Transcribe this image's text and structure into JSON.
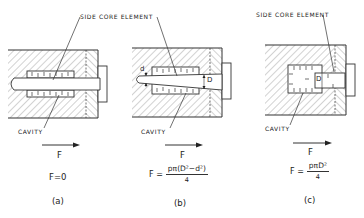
{
  "figure": {
    "panels": [
      {
        "id": "a",
        "caption": "(a)",
        "top_label": "SIDE CORE ELEMENT",
        "bottom_label": "CAVITY",
        "force_label": "F",
        "equation": "F=0"
      },
      {
        "id": "b",
        "caption": "(b)",
        "top_label": "SIDE CORE ELEMENT",
        "bottom_label": "CAVITY",
        "force_label": "F",
        "equation_lhs": "F =",
        "equation_numerator": "pπ(D²−d²)",
        "equation_denominator": "4",
        "dimension_small": "d",
        "dimension_large": "D"
      },
      {
        "id": "c",
        "caption": "(c)",
        "top_label": "SIDE CORE ELEMENT",
        "bottom_label": "CAVITY",
        "force_label": "F",
        "equation_lhs": "F =",
        "equation_numerator": "pπD²",
        "equation_denominator": "4",
        "dimension_large": "D"
      }
    ],
    "colors": {
      "line": "#333333",
      "hatch": "#555555",
      "background": "#ffffff"
    }
  }
}
